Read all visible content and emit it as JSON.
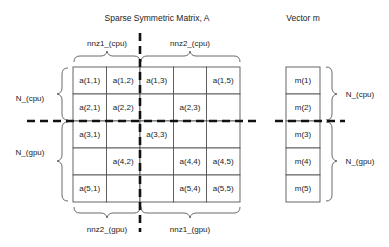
{
  "titles": {
    "matrix": "Sparse Symmetric Matrix, A",
    "vector": "Vector m"
  },
  "matrix": {
    "rows": [
      [
        "a(1,1)",
        "a(1,2)",
        "a(1,3)",
        "",
        "a(1,5)"
      ],
      [
        "a(2,1)",
        "a(2,2)",
        "",
        "a(2,3)",
        ""
      ],
      [
        "a(3,1)",
        "",
        "a(3,3)",
        "",
        ""
      ],
      [
        "",
        "a(4,2)",
        "",
        "a(4,4)",
        "a(4,5)"
      ],
      [
        "a(5,1)",
        "",
        "",
        "a(5,4)",
        "a(5,5)"
      ]
    ]
  },
  "vector": {
    "cells": [
      "m(1)",
      "m(2)",
      "m(3)",
      "m(4)",
      "m(5)"
    ]
  },
  "braces": {
    "top_left": "nnz1_(cpu)",
    "top_right": "nnz2_(cpu)",
    "bottom_left": "nnz2_(gpu)",
    "bottom_right": "nnz1_(gpu)",
    "left_top": "N_(cpu)",
    "left_bottom": "N_(gpu)",
    "right_top": "N_(cpu)",
    "right_bottom": "N_(gpu)"
  }
}
